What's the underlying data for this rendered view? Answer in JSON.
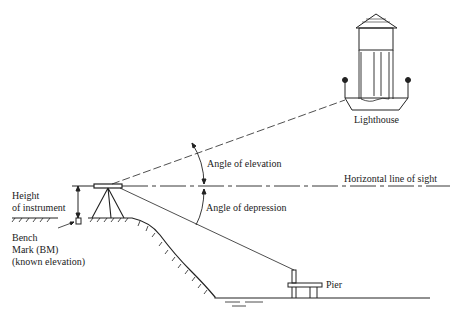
{
  "diagram": {
    "labels": {
      "lighthouse": "Lighthouse",
      "angle_elevation": "Angle of elevation",
      "horizontal_line": "Horizontal line of sight",
      "angle_depression": "Angle of  depression",
      "height_line1": "Height",
      "height_line2": "of instrument",
      "bench_line1": "Bench",
      "bench_line2": "Mark (BM)",
      "bench_line3": "(known elevation)",
      "pier": "Pier"
    },
    "colors": {
      "ink": "#222222",
      "background": "#ffffff"
    }
  }
}
